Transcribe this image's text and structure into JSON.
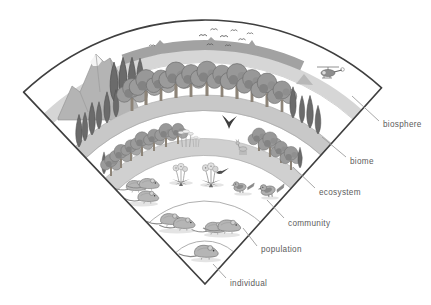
{
  "diagram": {
    "levels": [
      {
        "label": "biosphere"
      },
      {
        "label": "biome"
      },
      {
        "label": "ecosystem"
      },
      {
        "label": "community"
      },
      {
        "label": "population"
      },
      {
        "label": "individual"
      }
    ]
  },
  "colors": {
    "outline": "#3f3f3f",
    "label_text": "#5c5c5c",
    "leader_line": "#9e9e9e",
    "ground_strip": "#cccccc",
    "mountain": "#b3b3b3",
    "background": "#ffffff"
  }
}
